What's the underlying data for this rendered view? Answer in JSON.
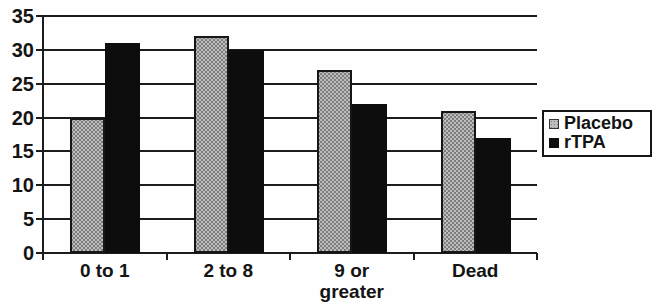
{
  "chart_data": {
    "type": "bar",
    "title": "",
    "xlabel": "",
    "ylabel": "",
    "categories": [
      "0 to 1",
      "2 to 8",
      "9 or greater",
      "Dead"
    ],
    "series": [
      {
        "name": "Placebo",
        "values": [
          20,
          32,
          27,
          21
        ],
        "swatch": "gray-halftone"
      },
      {
        "name": "rTPA",
        "values": [
          31,
          30,
          22,
          17
        ],
        "swatch": "solid-black"
      }
    ],
    "ylim": [
      0,
      35
    ],
    "yticks": [
      0,
      5,
      10,
      15,
      20,
      25,
      30,
      35
    ],
    "grid": true,
    "legend_position": "right",
    "colors": {
      "placebo_fill": "#bdbdbd",
      "placebo_dot": "#7e7e7e",
      "rtpa_fill": "#0d0d0d",
      "axis_line": "#1c1c1c",
      "background": "#fefefe"
    }
  }
}
